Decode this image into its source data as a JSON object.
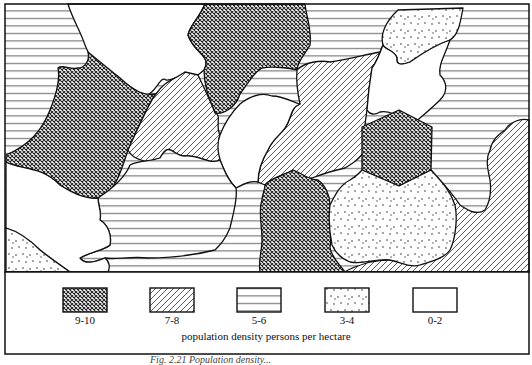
{
  "figure": {
    "type": "choropleth-map",
    "caption_partial": "Fig. 2.21  Population density..."
  },
  "legend": {
    "caption": "population density   persons per hectare",
    "items": [
      {
        "label": "9-10",
        "pattern": "crosshatch"
      },
      {
        "label": "7-8",
        "pattern": "diagonal-lines"
      },
      {
        "label": "5-6",
        "pattern": "horizontal-lines"
      },
      {
        "label": "3-4",
        "pattern": "dots"
      },
      {
        "label": "0-2",
        "pattern": "blank"
      }
    ]
  },
  "regions": [
    {
      "id": "r1",
      "class": "5-6",
      "pattern": "horizontal-lines",
      "location": "top-left"
    },
    {
      "id": "r2",
      "class": "9-10",
      "pattern": "crosshatch",
      "location": "left-center"
    },
    {
      "id": "r3",
      "class": "0-2",
      "pattern": "blank",
      "location": "top-center-left"
    },
    {
      "id": "r4",
      "class": "9-10",
      "pattern": "crosshatch",
      "location": "top-center"
    },
    {
      "id": "r5",
      "class": "7-8",
      "pattern": "diagonal-lines",
      "location": "center-left"
    },
    {
      "id": "r6",
      "class": "5-6",
      "pattern": "horizontal-lines",
      "location": "top-center-right"
    },
    {
      "id": "r7",
      "class": "3-4",
      "pattern": "dots",
      "location": "top-right-center"
    },
    {
      "id": "r8",
      "class": "5-6",
      "pattern": "horizontal-lines",
      "location": "right"
    },
    {
      "id": "r9",
      "class": "7-8",
      "pattern": "diagonal-lines",
      "location": "center"
    },
    {
      "id": "r10",
      "class": "0-2",
      "pattern": "blank",
      "location": "center"
    },
    {
      "id": "r11",
      "class": "0-2",
      "pattern": "blank",
      "location": "right-center"
    },
    {
      "id": "r12",
      "class": "9-10",
      "pattern": "crosshatch",
      "location": "hexagon-right"
    },
    {
      "id": "r13",
      "class": "0-2",
      "pattern": "blank",
      "location": "bottom-left"
    },
    {
      "id": "r14",
      "class": "5-6",
      "pattern": "horizontal-lines",
      "location": "bottom-center-left"
    },
    {
      "id": "r15",
      "class": "3-4",
      "pattern": "dots",
      "location": "bottom-left-corner"
    },
    {
      "id": "r16",
      "class": "9-10",
      "pattern": "crosshatch",
      "location": "bottom-center"
    },
    {
      "id": "r17",
      "class": "3-4",
      "pattern": "dots",
      "location": "bottom-right-center"
    },
    {
      "id": "r18",
      "class": "7-8",
      "pattern": "diagonal-lines",
      "location": "bottom-right"
    }
  ]
}
